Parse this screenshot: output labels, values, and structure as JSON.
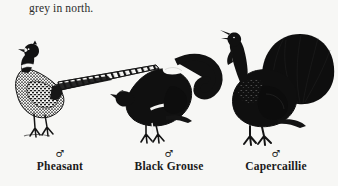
{
  "page": {
    "background_color": "#f7f7f5",
    "ink_color": "#121212",
    "top_note": "grey in north."
  },
  "plate": {
    "caption_kind": "field-guide illustration plate",
    "birds": [
      {
        "id": "pheasant",
        "name": "Pheasant",
        "sex_symbol": "♂",
        "sex": "male",
        "pose": "standing in profile, facing left, long pointed barred tail trailing up to the right",
        "features": "dark glossy head, white neck ring, finely mottled breast and flanks, very long tapering tail"
      },
      {
        "id": "black-grouse",
        "name": "Black Grouse",
        "sex_symbol": "♂",
        "sex": "male",
        "pose": "crouched display posture, head low facing left, lyre-shaped tail raised",
        "features": "all-black plumage, white undertail coverts, white wing bar, downcurved lyre tail"
      },
      {
        "id": "capercaillie",
        "name": "Capercaillie",
        "sex_symbol": "♂",
        "sex": "male",
        "pose": "upright display, head and beak raised and open, broad tail fanned",
        "features": "large dark body, shaggy throat beard, broad fanned black tail, heavy feathered legs"
      }
    ]
  }
}
